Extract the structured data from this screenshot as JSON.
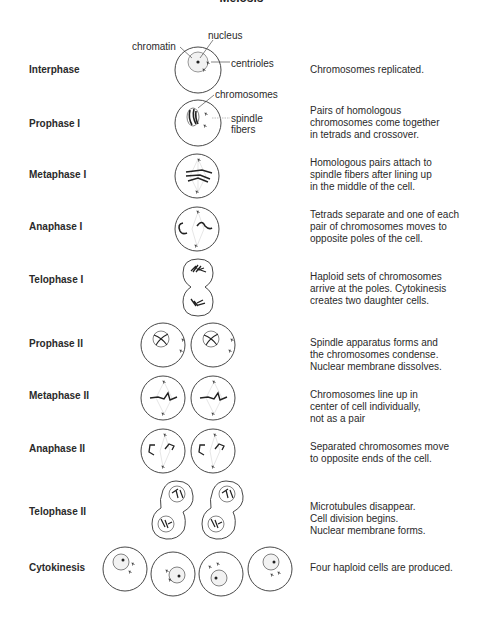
{
  "title": "Meiosis",
  "annotations": {
    "chromatin": "chromatin",
    "nucleus": "nucleus",
    "centrioles": "centrioles",
    "chromosomes": "chromosomes",
    "spindle_fibers": "spindle\nfibers"
  },
  "stages": [
    {
      "name": "Interphase",
      "description": "Chromosomes replicated."
    },
    {
      "name": "Prophase I",
      "description": "Pairs of homologous\nchromosomes come together\nin tetrads and crossover."
    },
    {
      "name": "Metaphase I",
      "description": "Homologous pairs attach to\nspindle fibers after lining up\nin the middle of the cell."
    },
    {
      "name": "Anaphase I",
      "description": "Tetrads separate and one of each\npair of chromosomes moves to\nopposite poles of the cell."
    },
    {
      "name": "Telophase I",
      "description": "Haploid sets of chromosomes\narrive at the poles. Cytokinesis\ncreates two daughter cells."
    },
    {
      "name": "Prophase II",
      "description": "Spindle apparatus forms and\nthe chromosomes condense.\nNuclear membrane dissolves."
    },
    {
      "name": "Metaphase II",
      "description": "Chromosomes line up in\ncenter of cell individually,\nnot as a pair"
    },
    {
      "name": "Anaphase II",
      "description": "Separated chromosomes move\nto opposite ends of the cell."
    },
    {
      "name": "Telophase II",
      "description": "Microtubules disappear.\nCell division begins.\nNuclear membrane forms."
    },
    {
      "name": "Cytokinesis",
      "description": "Four haploid cells are produced."
    }
  ],
  "colors": {
    "line": "#333333",
    "text": "#2a2a2a",
    "background": "#ffffff"
  }
}
